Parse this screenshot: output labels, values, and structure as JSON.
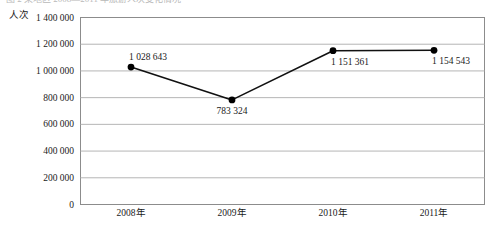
{
  "caption": {
    "text": "图 2  某地区 2008—2011 年旅游人次变化情况"
  },
  "chart_data": {
    "type": "line",
    "title": "",
    "xlabel": "",
    "ylabel": "人次",
    "categories": [
      "2008年",
      "2009年",
      "2010年",
      "2011年"
    ],
    "values": [
      1028643,
      783324,
      1151361,
      1154543
    ],
    "point_labels": [
      "1 028 643",
      "783 324",
      "1 151 361",
      "1 154 543"
    ],
    "ylim": [
      0,
      1400000
    ],
    "ytick_values": [
      0,
      200000,
      400000,
      600000,
      800000,
      1000000,
      1200000,
      1400000
    ],
    "ytick_labels": [
      "0",
      "200 000",
      "400 000",
      "600 000",
      "800 000",
      "1 000 000",
      "1 200 000",
      "1 400 000"
    ],
    "grid": true,
    "legend": "none",
    "series": [
      {
        "name": "人次",
        "values": [
          1028643,
          783324,
          1151361,
          1154543
        ]
      }
    ],
    "colors": {
      "line": "#111111",
      "marker": "#000000",
      "grid": "#b5b5b5",
      "frame": "#8c8c8c",
      "background": "#ffffff"
    }
  }
}
